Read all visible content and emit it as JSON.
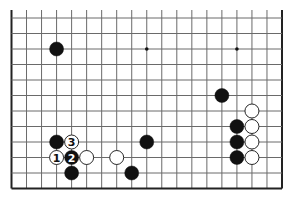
{
  "diagram": {
    "type": "go-board-diagram",
    "board": {
      "columns": 19,
      "visible_rows": 12,
      "edges": [
        "left",
        "right",
        "bottom"
      ],
      "line_color": "#6a6a6a",
      "edge_color": "#222222",
      "background": "#ffffff"
    },
    "star_points": [
      {
        "col": 3,
        "row": 2
      },
      {
        "col": 9,
        "row": 2
      },
      {
        "col": 15,
        "row": 2
      }
    ],
    "stones": [
      {
        "color": "black",
        "col": 3,
        "row": 2,
        "label": ""
      },
      {
        "color": "black",
        "col": 14,
        "row": 5,
        "label": ""
      },
      {
        "color": "white",
        "col": 16,
        "row": 6,
        "label": ""
      },
      {
        "color": "black",
        "col": 15,
        "row": 7,
        "label": ""
      },
      {
        "color": "white",
        "col": 16,
        "row": 7,
        "label": ""
      },
      {
        "color": "black",
        "col": 15,
        "row": 8,
        "label": ""
      },
      {
        "color": "white",
        "col": 16,
        "row": 8,
        "label": ""
      },
      {
        "color": "black",
        "col": 15,
        "row": 9,
        "label": ""
      },
      {
        "color": "white",
        "col": 16,
        "row": 9,
        "label": ""
      },
      {
        "color": "black",
        "col": 3,
        "row": 8,
        "label": ""
      },
      {
        "color": "white",
        "col": 4,
        "row": 8,
        "label": "3"
      },
      {
        "color": "black",
        "col": 9,
        "row": 8,
        "label": ""
      },
      {
        "color": "white",
        "col": 3,
        "row": 9,
        "label": "1"
      },
      {
        "color": "black",
        "col": 4,
        "row": 9,
        "label": "2"
      },
      {
        "color": "white",
        "col": 5,
        "row": 9,
        "label": ""
      },
      {
        "color": "white",
        "col": 7,
        "row": 9,
        "label": ""
      },
      {
        "color": "black",
        "col": 4,
        "row": 10,
        "label": ""
      },
      {
        "color": "black",
        "col": 8,
        "row": 10,
        "label": ""
      }
    ]
  }
}
